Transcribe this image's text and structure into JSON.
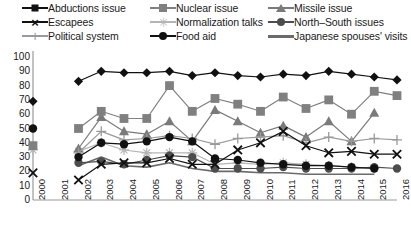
{
  "legend": {
    "items": [
      {
        "label": "Abductions issue",
        "marker": "diamond",
        "color": "#111111",
        "col": 0,
        "row": 0
      },
      {
        "label": "Escapees",
        "marker": "x",
        "color": "#111111",
        "col": 0,
        "row": 1
      },
      {
        "label": "Political system",
        "marker": "plus",
        "color": "#9a9a9a",
        "col": 0,
        "row": 2
      },
      {
        "label": "Nuclear issue",
        "marker": "square",
        "color": "#808080",
        "col": 1,
        "row": 0
      },
      {
        "label": "Normalization talks",
        "marker": "star",
        "color": "#b5b5b5",
        "col": 1,
        "row": 1
      },
      {
        "label": "Food aid",
        "marker": "circle-dark",
        "color": "#111111",
        "col": 1,
        "row": 2
      },
      {
        "label": "Missile issue",
        "marker": "triangle",
        "color": "#7a7a7a",
        "col": 2,
        "row": 0
      },
      {
        "label": "North–South issues",
        "marker": "circle-mid",
        "color": "#4d4d4d",
        "col": 2,
        "row": 1
      },
      {
        "label": "Japanese spouses' visits",
        "marker": "line",
        "color": "#6b6b6b",
        "col": 2,
        "row": 2
      }
    ]
  },
  "chart_data": {
    "type": "line",
    "title": "",
    "xlabel": "",
    "ylabel": "",
    "ylim": [
      0,
      100
    ],
    "ytick_step": 10,
    "grid": false,
    "legend_position": "top",
    "categories": [
      "2000",
      "2001",
      "2002",
      "2003",
      "2004",
      "2005",
      "2006",
      "2007",
      "2008",
      "2009",
      "2010",
      "2011",
      "2012",
      "2013",
      "2014",
      "2015",
      "2016"
    ],
    "yticks": [
      "100",
      "90",
      "80",
      "70",
      "60",
      "50",
      "40",
      "30",
      "20",
      "10",
      "0"
    ],
    "series": [
      {
        "name": "Abductions issue",
        "marker": "diamond",
        "color": "#111111",
        "values": [
          69,
          null,
          83,
          90,
          89,
          89,
          90,
          87,
          89,
          87,
          86,
          88,
          87,
          90,
          88,
          86,
          84
        ]
      },
      {
        "name": "Nuclear issue",
        "marker": "square",
        "color": "#808080",
        "values": [
          38,
          null,
          50,
          62,
          57,
          57,
          80,
          62,
          71,
          67,
          62,
          72,
          64,
          70,
          60,
          76,
          73
        ]
      },
      {
        "name": "Missile issue",
        "marker": "triangle",
        "color": "#7a7a7a",
        "values": [
          null,
          null,
          36,
          58,
          48,
          46,
          55,
          41,
          63,
          55,
          47,
          52,
          44,
          55,
          41,
          61,
          null
        ]
      },
      {
        "name": "Escapees",
        "marker": "x",
        "color": "#111111",
        "values": [
          19,
          null,
          14,
          25,
          26,
          26,
          29,
          25,
          25,
          35,
          40,
          48,
          38,
          33,
          34,
          32,
          32
        ]
      },
      {
        "name": "Political system",
        "marker": "plus",
        "color": "#9a9a9a",
        "values": [
          null,
          null,
          33,
          48,
          42,
          43,
          45,
          43,
          39,
          43,
          44,
          45,
          40,
          44,
          41,
          43,
          42
        ]
      },
      {
        "name": "Normalization talks",
        "marker": "star",
        "color": "#b5b5b5",
        "values": [
          35,
          null,
          34,
          40,
          35,
          33,
          33,
          33,
          25,
          26,
          25,
          26,
          25,
          24,
          23,
          22,
          null
        ]
      },
      {
        "name": "Food aid",
        "marker": "circle-dark",
        "color": "#111111",
        "values": [
          50,
          null,
          30,
          40,
          39,
          41,
          44,
          41,
          29,
          28,
          26,
          25,
          24,
          24,
          23,
          22,
          null
        ]
      },
      {
        "name": "North–South issues",
        "marker": "circle-mid",
        "color": "#4d4d4d",
        "values": [
          null,
          null,
          26,
          27,
          25,
          28,
          31,
          30,
          22,
          22,
          22,
          23,
          22,
          22,
          22,
          23,
          22
        ]
      },
      {
        "name": "Japanese spouses' visits",
        "marker": "line",
        "color": "#6b6b6b",
        "values": [
          null,
          null,
          24,
          30,
          24,
          23,
          26,
          22,
          20,
          20,
          19,
          19,
          18,
          18,
          18,
          18,
          null
        ]
      }
    ]
  },
  "caption": ""
}
